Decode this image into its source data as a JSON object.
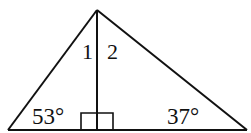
{
  "diagram": {
    "type": "right-triangle-with-altitude",
    "stroke_color": "#111111",
    "background": "#ffffff",
    "vertices": {
      "apex": {
        "x": 97,
        "y": 10
      },
      "base_left": {
        "x": 8,
        "y": 130
      },
      "base_right": {
        "x": 247,
        "y": 130
      },
      "foot": {
        "x": 97,
        "y": 130
      }
    },
    "labels": {
      "angle_left": "53°",
      "angle_right": "37°",
      "angle_1": "1",
      "angle_2": "2"
    },
    "right_angle_marker": {
      "x1": 81,
      "x2": 113,
      "y_top": 113,
      "y_base": 130
    }
  }
}
